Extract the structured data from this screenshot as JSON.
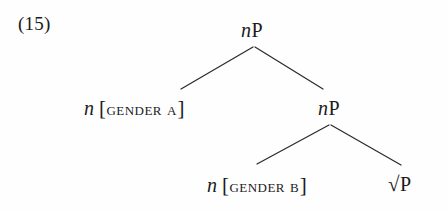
{
  "figure": {
    "example_number": "(15)",
    "type": "syntax-tree",
    "background_color": "#fefefe",
    "ink_color": "#1b1b1b",
    "branch_color": "#2b2b2b"
  },
  "tree": {
    "root": {
      "label_n": "n",
      "label_p": "P",
      "full_text": "nP"
    },
    "left_daughter": {
      "head": "n",
      "open_bracket": "[",
      "feature": "gender a",
      "close_bracket": "]",
      "full_text": "n [GENDER A]"
    },
    "right_daughter": {
      "label_n": "n",
      "label_p": "P",
      "full_text": "nP"
    },
    "lower_left_daughter": {
      "head": "n",
      "open_bracket": "[",
      "feature": "gender b",
      "close_bracket": "]",
      "full_text": "n [GENDER B]"
    },
    "lower_right_daughter": {
      "radical": "√",
      "label_p": "P",
      "full_text": "√P"
    }
  },
  "branches": {
    "upper_left": {
      "x1": 253,
      "y1": 47,
      "x2": 181,
      "y2": 89
    },
    "upper_right": {
      "x1": 255,
      "y1": 47,
      "x2": 323,
      "y2": 89
    },
    "lower_left": {
      "x1": 329,
      "y1": 125,
      "x2": 257,
      "y2": 164
    },
    "lower_right": {
      "x1": 331,
      "y1": 125,
      "x2": 401,
      "y2": 165
    }
  }
}
